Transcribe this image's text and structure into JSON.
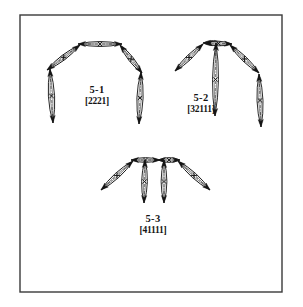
{
  "figure": {
    "background_color": "#ffffff",
    "ink_color": "#141414",
    "frame": {
      "name": "figure-border",
      "x": 20,
      "y": 15,
      "width": 262,
      "height": 277,
      "stroke_color": "#3a3a3a",
      "stroke_width": 1.4
    },
    "subfigures": [
      {
        "id": "5-1",
        "name_label": "5-1",
        "code_label": "[2221]",
        "name_label_x": 97,
        "name_label_y": 93,
        "code_label_x": 97,
        "code_label_y": 104,
        "link_count": 4,
        "links": [
          {
            "name": "link-top",
            "x1": 78,
            "y1": 44,
            "x2": 122,
            "y2": 44,
            "width": 5.0
          },
          {
            "name": "link-upper-left",
            "x1": 80,
            "y1": 45,
            "x2": 47,
            "y2": 70,
            "width": 5.0
          },
          {
            "name": "link-upper-right",
            "x1": 120,
            "y1": 45,
            "x2": 142,
            "y2": 73,
            "width": 5.0
          },
          {
            "name": "link-lower-left",
            "x1": 50,
            "y1": 69,
            "x2": 53,
            "y2": 123,
            "width": 6.2
          },
          {
            "name": "link-lower-right",
            "x1": 141,
            "y1": 72,
            "x2": 139,
            "y2": 124,
            "width": 6.2
          }
        ]
      },
      {
        "id": "5-2",
        "name_label": "5-2",
        "code_label": "[32111]",
        "name_label_x": 201,
        "name_label_y": 101,
        "code_label_x": 201,
        "code_label_y": 112,
        "link_count": 5,
        "links": [
          {
            "name": "link-top-left",
            "x1": 203,
            "y1": 43,
            "x2": 222,
            "y2": 43,
            "width": 4.6
          },
          {
            "name": "link-top-right",
            "x1": 205,
            "y1": 43,
            "x2": 232,
            "y2": 44,
            "width": 4.6
          },
          {
            "name": "link-upper-left",
            "x1": 203,
            "y1": 44,
            "x2": 175,
            "y2": 71,
            "width": 5.0
          },
          {
            "name": "link-upper-right",
            "x1": 230,
            "y1": 45,
            "x2": 259,
            "y2": 73,
            "width": 5.0
          },
          {
            "name": "link-center-vertical",
            "x1": 216,
            "y1": 43,
            "x2": 215,
            "y2": 116,
            "width": 6.0
          },
          {
            "name": "link-right-vertical",
            "x1": 259,
            "y1": 74,
            "x2": 261,
            "y2": 127,
            "width": 6.0
          }
        ]
      },
      {
        "id": "5-3",
        "name_label": "5-3",
        "code_label": "[41111]",
        "name_label_x": 153,
        "name_label_y": 222,
        "code_label_x": 153,
        "code_label_y": 233,
        "link_count": 6,
        "links": [
          {
            "name": "link-top-left",
            "x1": 131,
            "y1": 160,
            "x2": 160,
            "y2": 160,
            "width": 4.8
          },
          {
            "name": "link-top-right",
            "x1": 158,
            "y1": 160,
            "x2": 180,
            "y2": 160,
            "width": 4.8
          },
          {
            "name": "link-diag-left",
            "x1": 133,
            "y1": 161,
            "x2": 101,
            "y2": 190,
            "width": 5.2
          },
          {
            "name": "link-diag-right",
            "x1": 178,
            "y1": 161,
            "x2": 210,
            "y2": 190,
            "width": 5.2
          },
          {
            "name": "link-vert-inner-left",
            "x1": 145,
            "y1": 160,
            "x2": 144,
            "y2": 203,
            "width": 5.8
          },
          {
            "name": "link-vert-inner-right",
            "x1": 164,
            "y1": 160,
            "x2": 164,
            "y2": 203,
            "width": 5.8
          }
        ]
      }
    ]
  }
}
